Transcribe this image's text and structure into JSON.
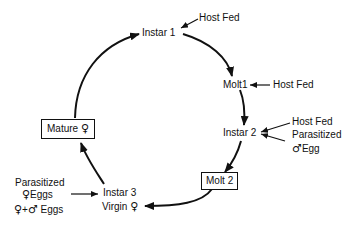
{
  "diagram": {
    "type": "life-cycle",
    "stages": [
      {
        "id": "instar1",
        "label": "Instar 1",
        "boxed": false
      },
      {
        "id": "molt1",
        "label": "Molt1",
        "boxed": false
      },
      {
        "id": "instar2",
        "label": "Instar 2",
        "boxed": false
      },
      {
        "id": "molt2",
        "label": "Molt 2",
        "boxed": true
      },
      {
        "id": "instar3",
        "label": "Instar 3",
        "sublabel": "Virgin",
        "sublabel_symbol": "♀",
        "boxed": false
      },
      {
        "id": "mature",
        "label": "Mature",
        "symbol": "♀",
        "boxed": true
      }
    ],
    "inputs": {
      "instar1": [
        "Host Fed"
      ],
      "molt1": [
        "Host Fed"
      ],
      "instar2": {
        "line1": "Host Fed",
        "line2": "Parasitized",
        "line3_symbol": "♂",
        "line3_text": "Egg"
      },
      "instar3": {
        "line1": "Parasitized",
        "line2_symbol": "♀",
        "line2_text": "Eggs",
        "line3_symbol_a": "♀",
        "line3_plus": "+",
        "line3_symbol_b": "♂",
        "line3_text": "Eggs"
      }
    },
    "edges": [
      [
        "instar1",
        "molt1"
      ],
      [
        "molt1",
        "instar2"
      ],
      [
        "instar2",
        "molt2"
      ],
      [
        "molt2",
        "instar3"
      ],
      [
        "instar3",
        "mature"
      ],
      [
        "mature",
        "instar1"
      ]
    ],
    "colors": {
      "stroke": "#111111",
      "background": "#ffffff"
    }
  }
}
